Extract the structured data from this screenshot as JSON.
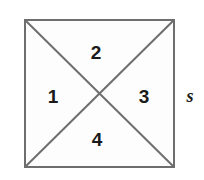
{
  "figure": {
    "background_color": "#ffffff",
    "shape": {
      "name": "square",
      "fill_color": "#fdfdfd",
      "stroke_color": "#6e6e6e",
      "stroke_width": 2,
      "left": 24,
      "top": 19,
      "right": 175,
      "bottom": 168,
      "width": 151,
      "height": 149
    },
    "diagonals": {
      "stroke_color": "#6e6e6e",
      "stroke_width": 2,
      "count": 2,
      "intersection": {
        "x": 99.5,
        "y": 93.5
      },
      "lines": [
        {
          "name": "diagonal-tl-br",
          "x1": 24,
          "y1": 19,
          "x2": 175,
          "y2": 168
        },
        {
          "name": "diagonal-tr-bl",
          "x1": 175,
          "y1": 19,
          "x2": 24,
          "y2": 168
        }
      ]
    },
    "regions": [
      {
        "id": "region-1",
        "label": "1",
        "position": "left",
        "x": 53,
        "y": 96
      },
      {
        "id": "region-2",
        "label": "2",
        "position": "top",
        "x": 96,
        "y": 52
      },
      {
        "id": "region-3",
        "label": "3",
        "position": "right",
        "x": 144,
        "y": 96
      },
      {
        "id": "region-4",
        "label": "4",
        "position": "bottom",
        "x": 97,
        "y": 139
      }
    ],
    "side_label": {
      "id": "side-label-s",
      "label": "s",
      "position": "outside-right-edge",
      "x": 190,
      "y": 96,
      "style": "italic bold serif",
      "color": "#1a1a1a"
    }
  }
}
